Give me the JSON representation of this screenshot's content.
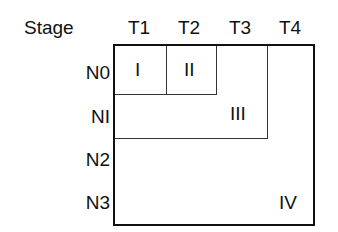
{
  "header": {
    "title": "Stage"
  },
  "columns": [
    "T1",
    "T2",
    "T3",
    "T4"
  ],
  "rows": [
    "N0",
    "NI",
    "N2",
    "N3"
  ],
  "regions": [
    {
      "label": "I",
      "covers": "T1 x N0"
    },
    {
      "label": "II",
      "covers": "T2 x N0"
    },
    {
      "label": "III",
      "covers": "T1-T3 x N0-NI (excluding I, II)"
    },
    {
      "label": "IV",
      "covers": "remaining T1-T4 x N0-N3"
    }
  ],
  "labels": {
    "I": "I",
    "II": "II",
    "III": "III",
    "IV": "IV"
  }
}
